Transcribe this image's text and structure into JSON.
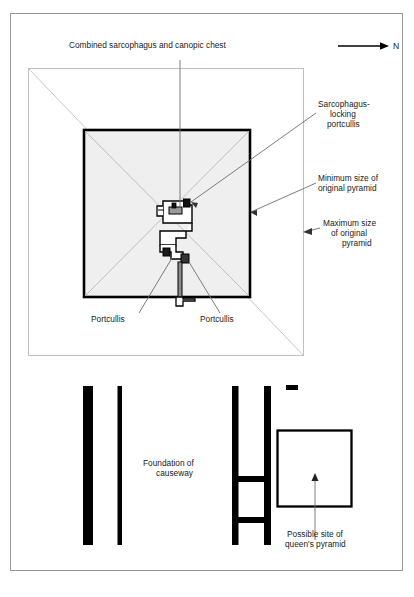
{
  "figure": {
    "title_label": "Combined sarcophagus and canopic chest",
    "compass": {
      "letter": "N",
      "icon": "north-arrow-icon"
    },
    "labels": {
      "sarcophagus_locking_portcullis_line1": "Sarcophagus-",
      "sarcophagus_locking_portcullis_line2": "locking",
      "sarcophagus_locking_portcullis_line3": "portcullis",
      "minimum_size_line1": "Minimum size of",
      "minimum_size_line2": "original pyramid",
      "maximum_size_line1": "Maximum size",
      "maximum_size_line2": "of original",
      "maximum_size_line3": "pyramid",
      "portcullis_left": "Portcullis",
      "portcullis_right": "Portcullis",
      "foundation_line1": "Foundation of",
      "foundation_line2": "causeway",
      "queens_pyramid_line1": "Possible site of",
      "queens_pyramid_line2": "queen's pyramid"
    },
    "colors": {
      "page_border": "#9a9a9a",
      "outline_light": "#b9b9b9",
      "fill_light": "#efefef",
      "ink": "#000000",
      "text": "#1a1a1a",
      "leader": "#6e6e6e"
    }
  }
}
